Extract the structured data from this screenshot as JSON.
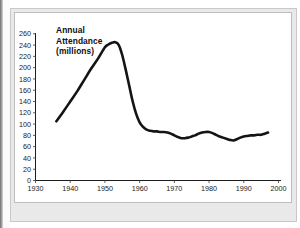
{
  "figure": {
    "title_lines": [
      "Annual",
      "Attendance",
      "(millions)"
    ],
    "line_color": "#141414",
    "axis_color": "#1d1d1d",
    "background_color": "#ffffff",
    "mount_color": "#e9e9e9"
  },
  "chart_data": {
    "type": "line",
    "title": "Annual Attendance (millions)",
    "xlabel": "",
    "ylabel": "Annual Attendance (millions)",
    "xlim": [
      1930,
      2000
    ],
    "ylim": [
      0,
      260
    ],
    "grid": false,
    "legend": "none",
    "x_ticks": [
      1930,
      1940,
      1950,
      1960,
      1970,
      1980,
      1990,
      2000
    ],
    "x_tick_labels": [
      "1930",
      "1940",
      "1950",
      "1960",
      "1970",
      "1980",
      "1990",
      "2000"
    ],
    "y_ticks": [
      0,
      20,
      40,
      60,
      80,
      100,
      120,
      140,
      160,
      180,
      200,
      220,
      240,
      260
    ],
    "y_tick_labels": [
      "0",
      "20",
      "40",
      "60",
      "80",
      "100",
      "120",
      "140",
      "160",
      "180",
      "200",
      "220",
      "240",
      "260"
    ],
    "series": [
      {
        "name": "Annual Attendance",
        "x": [
          1936,
          1938,
          1940,
          1942,
          1944,
          1946,
          1948,
          1950,
          1951,
          1952,
          1953,
          1954,
          1955,
          1956,
          1957,
          1958,
          1959,
          1960,
          1961,
          1962,
          1963,
          1964,
          1965,
          1966,
          1967,
          1968,
          1969,
          1970,
          1971,
          1972,
          1973,
          1974,
          1975,
          1976,
          1977,
          1978,
          1979,
          1980,
          1981,
          1982,
          1983,
          1984,
          1985,
          1986,
          1987,
          1988,
          1989,
          1990,
          1991,
          1992,
          1993,
          1994,
          1995,
          1996,
          1997
        ],
        "values": [
          105,
          122,
          140,
          158,
          178,
          198,
          216,
          236,
          241,
          244,
          245,
          240,
          222,
          196,
          168,
          140,
          118,
          103,
          95,
          90,
          88,
          87,
          87,
          86,
          86,
          85,
          83,
          80,
          77,
          75,
          75,
          76,
          78,
          80,
          83,
          85,
          86,
          86,
          84,
          81,
          78,
          76,
          74,
          72,
          71,
          73,
          76,
          78,
          79,
          80,
          80,
          81,
          81,
          83,
          85
        ]
      }
    ],
    "annotations": [
      {
        "text": "Annual Attendance (millions)",
        "x": 1938,
        "y": 250,
        "bold": true
      }
    ]
  }
}
